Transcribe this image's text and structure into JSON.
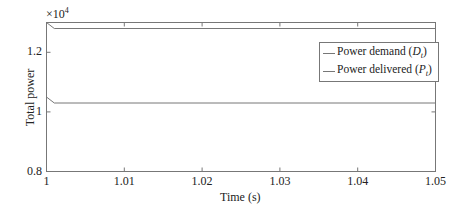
{
  "chart_data": {
    "type": "line",
    "title": "",
    "xlabel": "Time (s)",
    "ylabel": "Total power",
    "y_multiplier": "×10^4",
    "xlim": [
      1,
      1.05
    ],
    "ylim": [
      0.8,
      1.3
    ],
    "x_ticks": [
      "1",
      "1.01",
      "1.02",
      "1.03",
      "1.04",
      "1.05"
    ],
    "y_ticks": [
      "0.8",
      "1",
      "1.2"
    ],
    "grid": false,
    "legend_position": "upper right",
    "series": [
      {
        "name": "Power demand (D_t)",
        "x": [
          1,
          1.001,
          1.05
        ],
        "values": [
          1.3,
          1.28,
          1.28
        ],
        "color": "#777777"
      },
      {
        "name": "Power delivered (P_t)",
        "x": [
          1,
          1.001,
          1.05
        ],
        "values": [
          1.05,
          1.03,
          1.03
        ],
        "color": "#777777"
      }
    ]
  },
  "labels": {
    "multiplier_base": "×10",
    "multiplier_exp": "4",
    "xlabel": "Time (s)",
    "ylabel": "Total power",
    "legend": [
      {
        "prefix": "Power demand (",
        "sym": "D",
        "sub": "t",
        "suffix": ")"
      },
      {
        "prefix": "Power delivered (",
        "sym": "P",
        "sub": "t",
        "suffix": ")"
      }
    ],
    "x_ticks": [
      "1",
      "1.01",
      "1.02",
      "1.03",
      "1.04",
      "1.05"
    ],
    "y_ticks": [
      "0.8",
      "1",
      "1.2"
    ]
  }
}
